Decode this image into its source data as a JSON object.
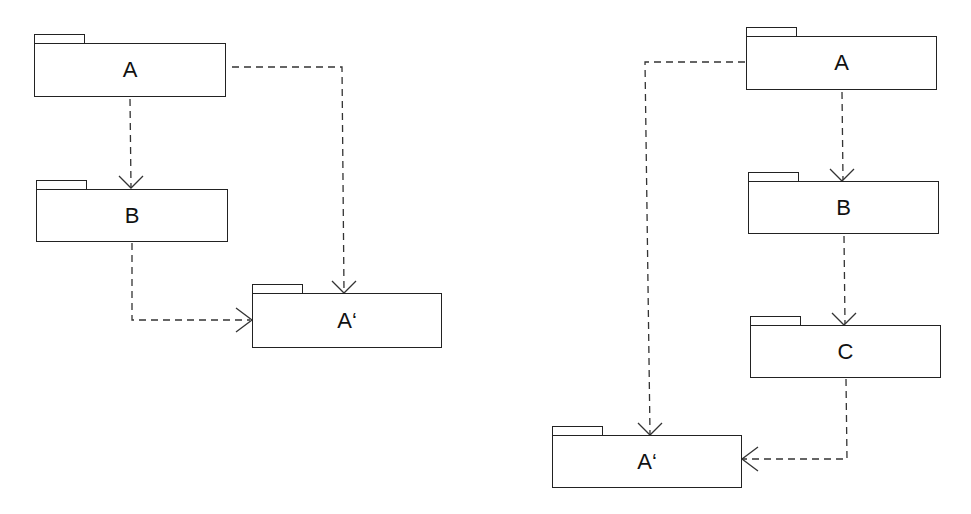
{
  "diagrams": [
    {
      "name": "left",
      "packages": [
        {
          "id": "A",
          "label": "A"
        },
        {
          "id": "B",
          "label": "B"
        },
        {
          "id": "A_prime",
          "label": "A‘"
        }
      ],
      "dependencies": [
        {
          "from": "A",
          "to": "B"
        },
        {
          "from": "A",
          "to": "A_prime"
        },
        {
          "from": "B",
          "to": "A_prime"
        }
      ]
    },
    {
      "name": "right",
      "packages": [
        {
          "id": "A",
          "label": "A"
        },
        {
          "id": "B",
          "label": "B"
        },
        {
          "id": "C",
          "label": "C"
        },
        {
          "id": "A_prime",
          "label": "A‘"
        }
      ],
      "dependencies": [
        {
          "from": "A",
          "to": "B"
        },
        {
          "from": "B",
          "to": "C"
        },
        {
          "from": "A",
          "to": "A_prime"
        },
        {
          "from": "C",
          "to": "A_prime"
        }
      ]
    }
  ],
  "style": {
    "line_color": "#222222",
    "background": "#ffffff"
  }
}
